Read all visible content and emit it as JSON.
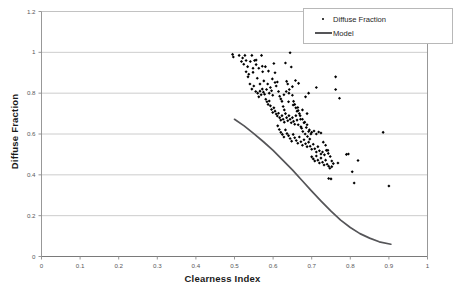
{
  "chart_data": {
    "type": "scatter",
    "title": "",
    "xlabel": "Clearness Index",
    "ylabel": "Diffuse Fraction",
    "xlim": [
      0,
      1
    ],
    "ylim": [
      0,
      1.2
    ],
    "xticks": [
      "0",
      "0.1",
      "0.2",
      "0.3",
      "0.4",
      "0.5",
      "0.6",
      "0.7",
      "0.8",
      "0.9",
      "1"
    ],
    "xtick_values": [
      0,
      0.1,
      0.2,
      0.3,
      0.4,
      0.5,
      0.6,
      0.7,
      0.8,
      0.9,
      1
    ],
    "yticks": [
      "0",
      "0.2",
      "0.4",
      "0.6",
      "0.8",
      "1",
      "1.2"
    ],
    "ytick_values": [
      0,
      0.2,
      0.4,
      0.6,
      0.8,
      1.0,
      1.2
    ],
    "grid": "horizontal",
    "legend_position": "top-right",
    "legend": [
      {
        "label": "Diffuse Fraction",
        "type": "marker",
        "color": "#000000"
      },
      {
        "label": "Model",
        "type": "line",
        "color": "#555558"
      }
    ],
    "series": [
      {
        "name": "Diffuse Fraction",
        "type": "scatter",
        "marker": "diamond",
        "color": "#000000",
        "points": [
          [
            0.495,
            0.99
          ],
          [
            0.497,
            0.977
          ],
          [
            0.512,
            0.985
          ],
          [
            0.518,
            0.955
          ],
          [
            0.521,
            0.972
          ],
          [
            0.524,
            0.942
          ],
          [
            0.527,
            0.985
          ],
          [
            0.53,
            0.96
          ],
          [
            0.534,
            0.93
          ],
          [
            0.537,
            0.893
          ],
          [
            0.541,
            0.955
          ],
          [
            0.545,
            0.985
          ],
          [
            0.548,
            0.902
          ],
          [
            0.552,
            0.96
          ],
          [
            0.556,
            0.94
          ],
          [
            0.559,
            0.873
          ],
          [
            0.563,
            0.922
          ],
          [
            0.566,
            0.845
          ],
          [
            0.57,
            0.985
          ],
          [
            0.573,
            0.905
          ],
          [
            0.576,
            0.86
          ],
          [
            0.58,
            0.93
          ],
          [
            0.583,
            0.818
          ],
          [
            0.586,
            0.845
          ],
          [
            0.59,
            0.8
          ],
          [
            0.593,
            0.828
          ],
          [
            0.596,
            0.812
          ],
          [
            0.599,
            0.79
          ],
          [
            0.602,
            0.945
          ],
          [
            0.605,
            0.9
          ],
          [
            0.608,
            0.835
          ],
          [
            0.611,
            0.855
          ],
          [
            0.614,
            0.808
          ],
          [
            0.617,
            0.785
          ],
          [
            0.62,
            0.772
          ],
          [
            0.623,
            0.76
          ],
          [
            0.626,
            0.735
          ],
          [
            0.629,
            0.718
          ],
          [
            0.632,
            0.948
          ],
          [
            0.635,
            0.858
          ],
          [
            0.638,
            0.845
          ],
          [
            0.641,
            0.8
          ],
          [
            0.644,
            0.998
          ],
          [
            0.647,
            0.928
          ],
          [
            0.65,
            0.79
          ],
          [
            0.653,
            0.76
          ],
          [
            0.656,
            0.745
          ],
          [
            0.659,
            0.728
          ],
          [
            0.662,
            0.712
          ],
          [
            0.53,
            0.905
          ],
          [
            0.535,
            0.88
          ],
          [
            0.54,
            0.845
          ],
          [
            0.545,
            0.82
          ],
          [
            0.55,
            0.835
          ],
          [
            0.555,
            0.808
          ],
          [
            0.56,
            0.8
          ],
          [
            0.563,
            0.782
          ],
          [
            0.566,
            0.81
          ],
          [
            0.569,
            0.792
          ],
          [
            0.572,
            0.82
          ],
          [
            0.575,
            0.805
          ],
          [
            0.578,
            0.795
          ],
          [
            0.581,
            0.77
          ],
          [
            0.584,
            0.758
          ],
          [
            0.587,
            0.745
          ],
          [
            0.59,
            0.762
          ],
          [
            0.593,
            0.738
          ],
          [
            0.596,
            0.72
          ],
          [
            0.599,
            0.705
          ],
          [
            0.602,
            0.728
          ],
          [
            0.605,
            0.712
          ],
          [
            0.608,
            0.698
          ],
          [
            0.611,
            0.688
          ],
          [
            0.614,
            0.702
          ],
          [
            0.617,
            0.68
          ],
          [
            0.62,
            0.668
          ],
          [
            0.623,
            0.69
          ],
          [
            0.626,
            0.672
          ],
          [
            0.629,
            0.658
          ],
          [
            0.632,
            0.7
          ],
          [
            0.635,
            0.68
          ],
          [
            0.638,
            0.665
          ],
          [
            0.641,
            0.69
          ],
          [
            0.644,
            0.672
          ],
          [
            0.647,
            0.655
          ],
          [
            0.65,
            0.68
          ],
          [
            0.653,
            0.662
          ],
          [
            0.656,
            0.648
          ],
          [
            0.659,
            0.69
          ],
          [
            0.662,
            0.668
          ],
          [
            0.665,
            0.645
          ],
          [
            0.668,
            0.7
          ],
          [
            0.671,
            0.672
          ],
          [
            0.674,
            0.628
          ],
          [
            0.677,
            0.612
          ],
          [
            0.68,
            0.655
          ],
          [
            0.683,
            0.6
          ],
          [
            0.686,
            0.632
          ],
          [
            0.689,
            0.588
          ],
          [
            0.692,
            0.612
          ],
          [
            0.695,
            0.575
          ],
          [
            0.698,
            0.6
          ],
          [
            0.612,
            0.64
          ],
          [
            0.616,
            0.622
          ],
          [
            0.62,
            0.608
          ],
          [
            0.624,
            0.598
          ],
          [
            0.628,
            0.585
          ],
          [
            0.632,
            0.62
          ],
          [
            0.636,
            0.602
          ],
          [
            0.64,
            0.592
          ],
          [
            0.644,
            0.578
          ],
          [
            0.648,
            0.565
          ],
          [
            0.652,
            0.598
          ],
          [
            0.656,
            0.582
          ],
          [
            0.66,
            0.568
          ],
          [
            0.664,
            0.555
          ],
          [
            0.668,
            0.585
          ],
          [
            0.672,
            0.562
          ],
          [
            0.676,
            0.545
          ],
          [
            0.68,
            0.572
          ],
          [
            0.684,
            0.552
          ],
          [
            0.688,
            0.538
          ],
          [
            0.692,
            0.56
          ],
          [
            0.696,
            0.54
          ],
          [
            0.7,
            0.525
          ],
          [
            0.704,
            0.55
          ],
          [
            0.708,
            0.528
          ],
          [
            0.712,
            0.512
          ],
          [
            0.716,
            0.538
          ],
          [
            0.72,
            0.518
          ],
          [
            0.724,
            0.502
          ],
          [
            0.7,
            0.488
          ],
          [
            0.704,
            0.478
          ],
          [
            0.708,
            0.468
          ],
          [
            0.712,
            0.492
          ],
          [
            0.716,
            0.472
          ],
          [
            0.72,
            0.458
          ],
          [
            0.724,
            0.482
          ],
          [
            0.728,
            0.462
          ],
          [
            0.732,
            0.448
          ],
          [
            0.736,
            0.472
          ],
          [
            0.74,
            0.452
          ],
          [
            0.744,
            0.442
          ],
          [
            0.728,
            0.512
          ],
          [
            0.733,
            0.498
          ],
          [
            0.738,
            0.52
          ],
          [
            0.743,
            0.505
          ],
          [
            0.748,
            0.49
          ],
          [
            0.752,
            0.468
          ],
          [
            0.756,
            0.455
          ],
          [
            0.747,
            0.432
          ],
          [
            0.752,
            0.44
          ],
          [
            0.744,
            0.382
          ],
          [
            0.75,
            0.38
          ],
          [
            0.665,
            0.715
          ],
          [
            0.67,
            0.69
          ],
          [
            0.676,
            0.672
          ],
          [
            0.682,
            0.658
          ],
          [
            0.688,
            0.645
          ],
          [
            0.694,
            0.62
          ],
          [
            0.7,
            0.608
          ],
          [
            0.706,
            0.615
          ],
          [
            0.712,
            0.6
          ],
          [
            0.718,
            0.61
          ],
          [
            0.724,
            0.605
          ],
          [
            0.73,
            0.56
          ],
          [
            0.736,
            0.545
          ],
          [
            0.742,
            0.52
          ],
          [
            0.684,
            0.782
          ],
          [
            0.692,
            0.8
          ],
          [
            0.712,
            0.828
          ],
          [
            0.762,
            0.88
          ],
          [
            0.762,
            0.818
          ],
          [
            0.768,
            0.458
          ],
          [
            0.772,
            0.775
          ],
          [
            0.79,
            0.5
          ],
          [
            0.795,
            0.502
          ],
          [
            0.805,
            0.415
          ],
          [
            0.81,
            0.36
          ],
          [
            0.82,
            0.47
          ],
          [
            0.885,
            0.608
          ],
          [
            0.9,
            0.345
          ],
          [
            0.605,
            0.852
          ],
          [
            0.598,
            0.87
          ],
          [
            0.588,
            0.908
          ],
          [
            0.572,
            0.932
          ],
          [
            0.556,
            0.962
          ],
          [
            0.548,
            0.922
          ],
          [
            0.666,
            0.848
          ],
          [
            0.658,
            0.862
          ],
          [
            0.65,
            0.832
          ],
          [
            0.642,
            0.818
          ],
          [
            0.634,
            0.808
          ],
          [
            0.628,
            0.792
          ],
          [
            0.64,
            0.758
          ],
          [
            0.652,
            0.742
          ],
          [
            0.664,
            0.73
          ],
          [
            0.676,
            0.718
          ],
          [
            0.688,
            0.7
          ],
          [
            0.672,
            0.635
          ]
        ]
      },
      {
        "name": "Model",
        "type": "line",
        "color": "#555558",
        "points": [
          [
            0.5,
            0.672
          ],
          [
            0.525,
            0.64
          ],
          [
            0.55,
            0.602
          ],
          [
            0.575,
            0.562
          ],
          [
            0.6,
            0.52
          ],
          [
            0.625,
            0.472
          ],
          [
            0.65,
            0.424
          ],
          [
            0.675,
            0.372
          ],
          [
            0.7,
            0.32
          ],
          [
            0.725,
            0.27
          ],
          [
            0.75,
            0.222
          ],
          [
            0.775,
            0.178
          ],
          [
            0.8,
            0.142
          ],
          [
            0.825,
            0.112
          ],
          [
            0.85,
            0.09
          ],
          [
            0.875,
            0.072
          ],
          [
            0.905,
            0.06
          ]
        ]
      }
    ]
  },
  "axes": {
    "x_title": "Clearness Index",
    "y_title": "Diffuse Fraction"
  },
  "legend": {
    "diffuse_label": "Diffuse Fraction",
    "model_label": "Model"
  }
}
